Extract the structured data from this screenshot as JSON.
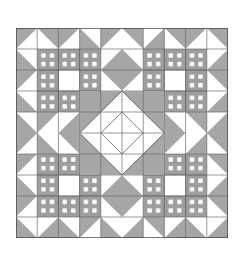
{
  "figure": {
    "name": "quilt-block-diagram",
    "background_color": "#ffffff",
    "canvas": {
      "width": 245,
      "height": 263
    }
  },
  "quilt": {
    "name": "patchwork-quilt-grid",
    "origin": {
      "x": 16,
      "y": 28
    },
    "size": {
      "width": 212,
      "height": 210
    },
    "blocks_across": 2,
    "blocks_down": 2,
    "units_per_block": 5,
    "unit_size": 21.2,
    "colors": {
      "light": "#ffffff",
      "medium": "#a6a6a6",
      "shade": "#9a9a9a",
      "outline": "#4a4a4a",
      "grid_line": "#6b6b6b",
      "plaid_strip": "#9e9e9e",
      "plaid_light": "#f2f2f2"
    },
    "line_width": 0.7,
    "patch_types": [
      "half-square-triangle",
      "flying-geese",
      "woven-plaid-nine-patch",
      "center-diamond",
      "plain-square"
    ],
    "blocks": [
      {
        "position": "top-left",
        "type": "sawtooth-plaid-star"
      },
      {
        "position": "top-right",
        "type": "sawtooth-plaid-star"
      },
      {
        "position": "bottom-left",
        "type": "sawtooth-plaid-star"
      },
      {
        "position": "bottom-right",
        "type": "sawtooth-plaid-star"
      }
    ],
    "center_medallion": {
      "name": "center-diamond-medallion",
      "shape": "square-in-a-square",
      "fill": "#ffffff",
      "surround_fill": "#a6a6a6"
    }
  }
}
